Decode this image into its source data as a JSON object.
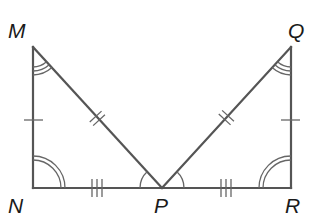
{
  "diagram": {
    "type": "geometry-congruent-triangles",
    "colors": {
      "line": "#555555",
      "mark": "#666666",
      "label": "#1a1a1a",
      "background": "#ffffff"
    },
    "vertices": {
      "M": {
        "label": "M",
        "x": 33,
        "y": 47
      },
      "N": {
        "label": "N",
        "x": 33,
        "y": 188
      },
      "P": {
        "label": "P",
        "x": 162,
        "y": 188
      },
      "Q": {
        "label": "Q",
        "x": 291,
        "y": 47
      },
      "R": {
        "label": "R",
        "x": 291,
        "y": 188
      }
    },
    "triangles": [
      {
        "name": "MNP",
        "vertices": [
          "M",
          "N",
          "P"
        ]
      },
      {
        "name": "QRP",
        "vertices": [
          "Q",
          "R",
          "P"
        ]
      }
    ],
    "segments": [
      {
        "from": "M",
        "to": "N",
        "ticks": 1
      },
      {
        "from": "N",
        "to": "P",
        "ticks": 3
      },
      {
        "from": "M",
        "to": "P",
        "ticks": 2
      },
      {
        "from": "Q",
        "to": "R",
        "ticks": 1
      },
      {
        "from": "R",
        "to": "P",
        "ticks": 3
      },
      {
        "from": "Q",
        "to": "P",
        "ticks": 2
      }
    ],
    "angle_marks": [
      {
        "vertex": "M",
        "arcs": 3
      },
      {
        "vertex": "N",
        "arcs": 2
      },
      {
        "vertex": "P",
        "side": "left",
        "arcs": 1
      },
      {
        "vertex": "Q",
        "arcs": 3
      },
      {
        "vertex": "R",
        "arcs": 2
      },
      {
        "vertex": "P",
        "side": "right",
        "arcs": 1
      }
    ]
  }
}
